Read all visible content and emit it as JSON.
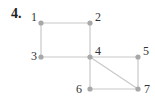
{
  "problem": {
    "number": "4."
  },
  "graph": {
    "edge_color": "#c8c8c8",
    "node_color": "#a8a8a8",
    "label_color": "#333333",
    "nodes": [
      {
        "id": "1",
        "label": "1",
        "x": 41,
        "y": 23,
        "lx": 31,
        "ly": 21
      },
      {
        "id": "2",
        "label": "2",
        "x": 90,
        "y": 23,
        "lx": 95,
        "ly": 21
      },
      {
        "id": "3",
        "label": "3",
        "x": 41,
        "y": 57,
        "lx": 31,
        "ly": 60
      },
      {
        "id": "4",
        "label": "4",
        "x": 90,
        "y": 57,
        "lx": 95,
        "ly": 55
      },
      {
        "id": "5",
        "label": "5",
        "x": 138,
        "y": 57,
        "lx": 143,
        "ly": 55
      },
      {
        "id": "6",
        "label": "6",
        "x": 90,
        "y": 89,
        "lx": 76,
        "ly": 93
      },
      {
        "id": "7",
        "label": "7",
        "x": 138,
        "y": 89,
        "lx": 144,
        "ly": 93
      }
    ],
    "edges": [
      [
        "1",
        "2"
      ],
      [
        "1",
        "3"
      ],
      [
        "2",
        "4"
      ],
      [
        "3",
        "4"
      ],
      [
        "4",
        "5"
      ],
      [
        "4",
        "6"
      ],
      [
        "4",
        "7"
      ],
      [
        "5",
        "7"
      ],
      [
        "6",
        "7"
      ]
    ]
  }
}
